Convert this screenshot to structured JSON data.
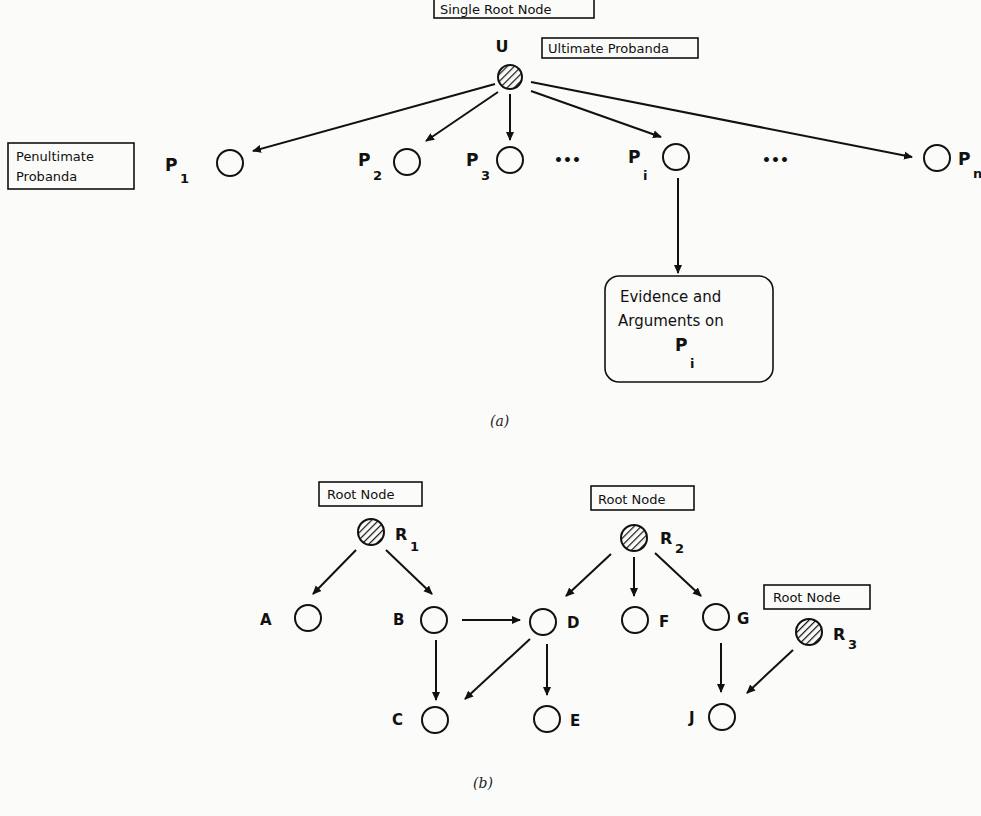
{
  "diagram_a": {
    "caption": "(a)",
    "labels": {
      "single_root": "Single Root Node",
      "ultimate": "Ultimate Probanda",
      "penultimate_line1": "Penultimate",
      "penultimate_line2": "Probanda",
      "evidence_line1": "Evidence and",
      "evidence_line2": "Arguments on",
      "evidence_p": "P",
      "evidence_sub": "i"
    },
    "nodes": {
      "U": {
        "label": "U",
        "type": "root"
      },
      "P1": {
        "label": "P",
        "sub": "1"
      },
      "P2": {
        "label": "P",
        "sub": "2"
      },
      "P3": {
        "label": "P",
        "sub": "3"
      },
      "Pi": {
        "label": "P",
        "sub": "i"
      },
      "Pn": {
        "label": "P",
        "sub": "n"
      }
    },
    "ellipsis": "•••",
    "edges": [
      [
        "U",
        "P1"
      ],
      [
        "U",
        "P2"
      ],
      [
        "U",
        "P3"
      ],
      [
        "U",
        "Pi"
      ],
      [
        "U",
        "Pn"
      ],
      [
        "Pi",
        "Evidence"
      ]
    ]
  },
  "diagram_b": {
    "caption": "(b)",
    "root_label": "Root Node",
    "nodes": {
      "R1": {
        "label": "R",
        "sub": "1",
        "type": "root"
      },
      "R2": {
        "label": "R",
        "sub": "2",
        "type": "root"
      },
      "R3": {
        "label": "R",
        "sub": "3",
        "type": "root"
      },
      "A": {
        "label": "A"
      },
      "B": {
        "label": "B"
      },
      "C": {
        "label": "C"
      },
      "D": {
        "label": "D"
      },
      "E": {
        "label": "E"
      },
      "F": {
        "label": "F"
      },
      "G": {
        "label": "G"
      },
      "J": {
        "label": "J"
      }
    },
    "edges": [
      [
        "R1",
        "A"
      ],
      [
        "R1",
        "B"
      ],
      [
        "B",
        "D"
      ],
      [
        "B",
        "C"
      ],
      [
        "D",
        "C"
      ],
      [
        "D",
        "E"
      ],
      [
        "R2",
        "D"
      ],
      [
        "R2",
        "F"
      ],
      [
        "R2",
        "G"
      ],
      [
        "G",
        "J"
      ],
      [
        "R3",
        "J"
      ]
    ]
  }
}
